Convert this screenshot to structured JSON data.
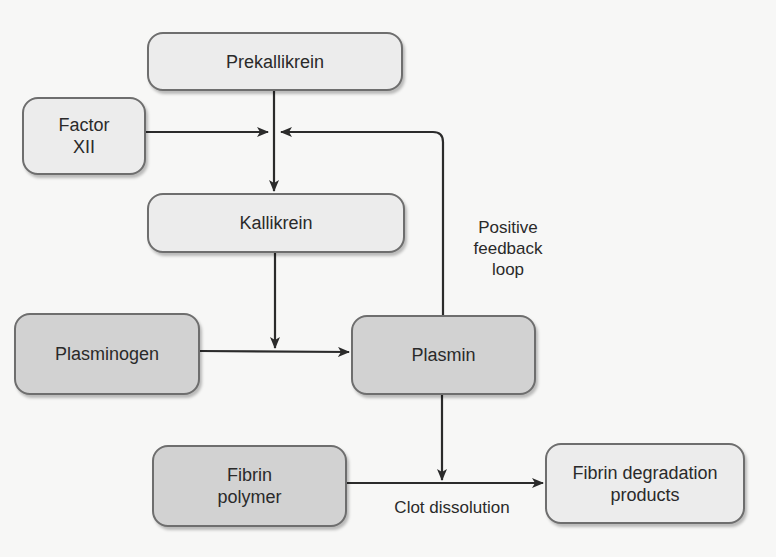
{
  "diagram": {
    "nodes": {
      "prekallikrein": {
        "label": "Prekallikrein",
        "shade": "light"
      },
      "factor_xii": {
        "line1": "Factor",
        "line2": "XII",
        "shade": "light"
      },
      "kallikrein": {
        "label": "Kallikrein",
        "shade": "light"
      },
      "plasminogen": {
        "label": "Plasminogen",
        "shade": "dark"
      },
      "plasmin": {
        "label": "Plasmin",
        "shade": "dark"
      },
      "fibrin_polymer": {
        "line1": "Fibrin",
        "line2": "polymer",
        "shade": "dark"
      },
      "fibrin_degradation": {
        "line1": "Fibrin degradation",
        "line2": "products",
        "shade": "light"
      }
    },
    "labels": {
      "feedback_line1": "Positive",
      "feedback_line2": "feedback",
      "feedback_line3": "loop",
      "clot_dissolution": "Clot dissolution"
    },
    "edges": [
      {
        "from": "Prekallikrein",
        "to": "Kallikrein"
      },
      {
        "from": "Factor XII",
        "to": "Prekallikrein→Kallikrein conversion"
      },
      {
        "from": "Plasmin",
        "to": "Prekallikrein→Kallikrein conversion",
        "label": "Positive feedback loop"
      },
      {
        "from": "Kallikrein",
        "to": "Plasminogen→Plasmin conversion"
      },
      {
        "from": "Plasminogen",
        "to": "Plasmin"
      },
      {
        "from": "Plasmin",
        "to": "Fibrin polymer→Fibrin degradation products conversion"
      },
      {
        "from": "Fibrin polymer",
        "to": "Fibrin degradation products",
        "label": "Clot dissolution"
      }
    ],
    "colors": {
      "light_box": "#ececec",
      "dark_box": "#d2d2d2",
      "stroke": "#333333"
    }
  }
}
